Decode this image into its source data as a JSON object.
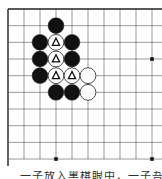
{
  "board": {
    "game": "Go",
    "origin_x": 8,
    "origin_y": 9,
    "cell_w": 16,
    "cell_h": 16.67,
    "cols": 10,
    "rows": 10,
    "line_color": "#555555",
    "edge_color": "#222222",
    "star_points": [
      [
        9,
        3
      ],
      [
        3,
        9
      ],
      [
        9,
        9
      ]
    ],
    "stones": [
      {
        "col": 3,
        "row": 1,
        "color": "black",
        "mark": ""
      },
      {
        "col": 2,
        "row": 2,
        "color": "black",
        "mark": ""
      },
      {
        "col": 3,
        "row": 2,
        "color": "white",
        "mark": "triangle"
      },
      {
        "col": 4,
        "row": 2,
        "color": "black",
        "mark": ""
      },
      {
        "col": 2,
        "row": 3,
        "color": "black",
        "mark": ""
      },
      {
        "col": 3,
        "row": 3,
        "color": "white",
        "mark": "triangle"
      },
      {
        "col": 4,
        "row": 3,
        "color": "black",
        "mark": ""
      },
      {
        "col": 2,
        "row": 4,
        "color": "black",
        "mark": ""
      },
      {
        "col": 3,
        "row": 4,
        "color": "white",
        "mark": "triangle"
      },
      {
        "col": 4,
        "row": 4,
        "color": "white",
        "mark": "triangle"
      },
      {
        "col": 5,
        "row": 4,
        "color": "white",
        "mark": ""
      },
      {
        "col": 3,
        "row": 5,
        "color": "black",
        "mark": ""
      },
      {
        "col": 4,
        "row": 5,
        "color": "black",
        "mark": ""
      },
      {
        "col": 5,
        "row": 5,
        "color": "white",
        "mark": ""
      }
    ]
  },
  "caption": {
    "text": "一子放入黑棋眼中，一子吾以"
  }
}
